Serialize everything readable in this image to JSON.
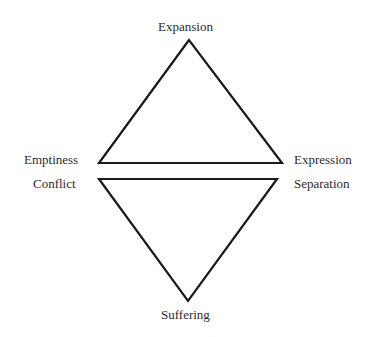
{
  "diagram": {
    "type": "two-triangles",
    "stroke_color": "#1a1a1a",
    "text_color": "#2b2b2b",
    "upper_triangle": {
      "apex": "Expansion",
      "left": "Emptiness",
      "right": "Expression",
      "points": "189,40 99,163 282,163"
    },
    "lower_triangle": {
      "apex": "Suffering",
      "left": "Conflict",
      "right": "Separation",
      "points": "99,179 277,179 188,301"
    }
  }
}
